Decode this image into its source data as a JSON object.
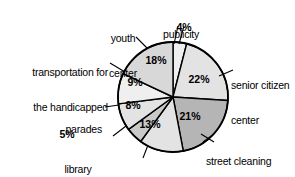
{
  "chart_data": {
    "type": "pie",
    "title": "",
    "subtitle": "",
    "xlabel": "",
    "ylabel": "",
    "legend_position": "none",
    "grid": false,
    "units": "percent",
    "start_angle_deg": 0,
    "direction": "clockwise",
    "categories": [
      "publicity",
      "senior citizen center",
      "street cleaning",
      "parks",
      "library aides",
      "parades",
      "transportation for the handicapped",
      "youth center"
    ],
    "values": [
      4,
      22,
      21,
      13,
      5,
      8,
      9,
      18
    ],
    "value_labels": [
      "4%",
      "22%",
      "21%",
      "13%",
      "5%",
      "8%",
      "9%",
      "18%"
    ],
    "slice_colors": [
      "#efefef",
      "#e3e3e3",
      "#b5b5b5",
      "#e3e3e3",
      "#c9c9c9",
      "#e3e3e3",
      "#efefef",
      "#d8d8d8"
    ],
    "stroke_color": "#000000"
  },
  "chart": {
    "slices": [
      {
        "name": "publicity",
        "percent_label": "4%",
        "label_line1": "publicity",
        "label_line2": "",
        "has_leader": true
      },
      {
        "name": "senior citizen center",
        "percent_label": "22%",
        "label_line1": "senior citizen",
        "label_line2": "center",
        "has_leader": true
      },
      {
        "name": "street cleaning",
        "percent_label": "21%",
        "label_line1": "street cleaning",
        "label_line2": "",
        "has_leader": true
      },
      {
        "name": "parks",
        "percent_label": "13%",
        "label_line1": "parks",
        "label_line2": "",
        "has_leader": true
      },
      {
        "name": "library aides",
        "percent_label": "5%",
        "label_line1": "library",
        "label_line2": "aides",
        "has_leader": true
      },
      {
        "name": "parades",
        "percent_label": "8%",
        "label_line1": "parades",
        "label_line2": "",
        "has_leader": true
      },
      {
        "name": "transportation for the handicapped",
        "percent_label": "9%",
        "label_line1": "transportation for",
        "label_line2": "the handicapped",
        "has_leader": true
      },
      {
        "name": "youth center",
        "percent_label": "18%",
        "label_line1": "youth",
        "label_line2": "center",
        "has_leader": true
      }
    ]
  }
}
